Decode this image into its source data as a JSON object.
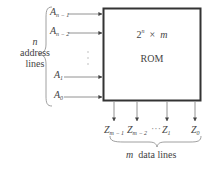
{
  "diagram": {
    "block": {
      "size_base": "2",
      "size_exp": "n",
      "size_times": "×",
      "size_width": "m",
      "name": "ROM"
    },
    "inputs": {
      "group_var": "n",
      "group_label_1": "address",
      "group_label_2": "lines",
      "lines": [
        {
          "base": "A",
          "sub": "n − 1"
        },
        {
          "base": "A",
          "sub": "n − 2"
        },
        {
          "base": "A",
          "sub": "1"
        },
        {
          "base": "A",
          "sub": "0"
        }
      ],
      "ellipsis": "⋮"
    },
    "outputs": {
      "group_var": "m",
      "group_label": "data lines",
      "lines": [
        {
          "base": "Z",
          "sub": "m − 1"
        },
        {
          "base": "Z",
          "sub": "m − 2"
        },
        {
          "base": "Z",
          "sub": "1"
        },
        {
          "base": "Z",
          "sub": "0"
        }
      ],
      "ellipsis": "···"
    },
    "colors": {
      "line": "#555555",
      "box_border": "#333333",
      "text": "#444444"
    }
  }
}
